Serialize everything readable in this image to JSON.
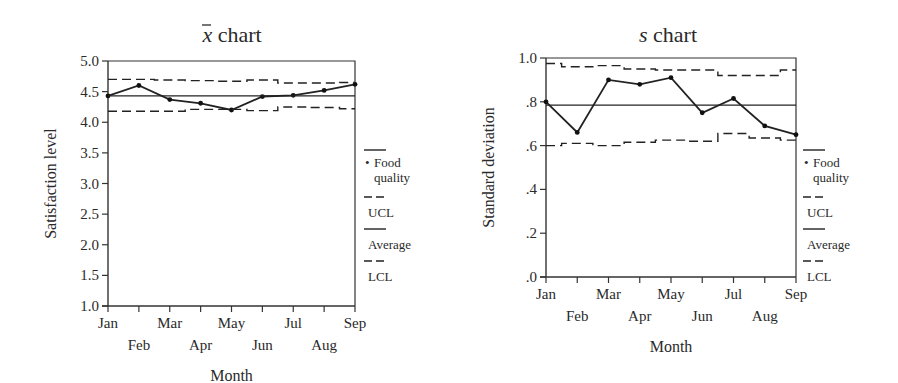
{
  "chart_data": [
    {
      "type": "line",
      "title": "x̄ chart",
      "title_symbol": "x",
      "title_rest": "chart",
      "xlabel": "Month",
      "ylabel": "Satisfaction level",
      "categories": [
        "Jan",
        "Feb",
        "Mar",
        "Apr",
        "May",
        "Jun",
        "Jul",
        "Aug",
        "Sep"
      ],
      "yticks": [
        "1.0",
        "1.5",
        "2.0",
        "2.5",
        "3.0",
        "3.5",
        "4.0",
        "4.5",
        "5.0"
      ],
      "ylim": [
        1.0,
        5.0
      ],
      "grid": false,
      "legend_position": "right",
      "series": [
        {
          "name": "Food quality",
          "style": "solid-with-markers",
          "values": [
            4.43,
            4.6,
            4.37,
            4.31,
            4.2,
            4.42,
            4.44,
            4.52,
            4.62
          ]
        },
        {
          "name": "UCL",
          "style": "dashed",
          "values": [
            4.7,
            4.7,
            4.69,
            4.68,
            4.67,
            4.69,
            4.64,
            4.64,
            4.65
          ]
        },
        {
          "name": "Average",
          "style": "solid",
          "values": [
            4.43,
            4.43,
            4.43,
            4.43,
            4.43,
            4.43,
            4.43,
            4.43,
            4.43
          ]
        },
        {
          "name": "LCL",
          "style": "dashed",
          "values": [
            4.18,
            4.18,
            4.18,
            4.21,
            4.21,
            4.19,
            4.25,
            4.24,
            4.22
          ]
        }
      ]
    },
    {
      "type": "line",
      "title": "s chart",
      "title_symbol": "s",
      "title_rest": "chart",
      "xlabel": "Month",
      "ylabel": "Standard deviation",
      "categories": [
        "Jan",
        "Feb",
        "Mar",
        "Apr",
        "May",
        "Jun",
        "Jul",
        "Aug",
        "Sep"
      ],
      "yticks": [
        ".0",
        ".2",
        ".4",
        ".6",
        ".8",
        "1.0"
      ],
      "ylim": [
        0.0,
        1.0
      ],
      "grid": false,
      "legend_position": "right",
      "series": [
        {
          "name": "Food quality",
          "style": "solid-with-markers",
          "values": [
            0.8,
            0.66,
            0.9,
            0.88,
            0.91,
            0.75,
            0.815,
            0.69,
            0.65
          ]
        },
        {
          "name": "UCL",
          "style": "dashed",
          "values": [
            0.975,
            0.96,
            0.965,
            0.95,
            0.945,
            0.945,
            0.92,
            0.92,
            0.945
          ]
        },
        {
          "name": "Average",
          "style": "solid",
          "values": [
            0.785,
            0.785,
            0.785,
            0.785,
            0.785,
            0.785,
            0.785,
            0.785,
            0.785
          ]
        },
        {
          "name": "LCL",
          "style": "dashed",
          "values": [
            0.6,
            0.61,
            0.6,
            0.615,
            0.625,
            0.62,
            0.655,
            0.635,
            0.625
          ]
        }
      ]
    }
  ],
  "legend": {
    "items": [
      {
        "label_line1": "Food",
        "label_line2": "quality",
        "marker": "•",
        "style": "solid"
      },
      {
        "label_line1": "UCL",
        "style": "dashed"
      },
      {
        "label_line1": "Average",
        "style": "solid"
      },
      {
        "label_line1": "LCL",
        "style": "dashed"
      }
    ]
  }
}
